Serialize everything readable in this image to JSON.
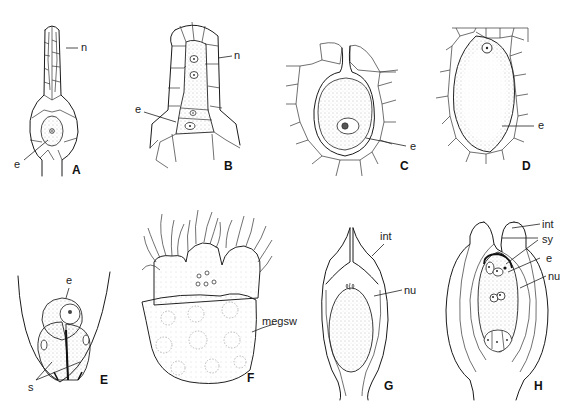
{
  "figure": {
    "panels": [
      {
        "id": "A",
        "label": "A",
        "annotations": [
          "n",
          "e"
        ]
      },
      {
        "id": "B",
        "label": "B",
        "annotations": [
          "n",
          "e"
        ]
      },
      {
        "id": "C",
        "label": "C",
        "annotations": [
          "e"
        ]
      },
      {
        "id": "D",
        "label": "D",
        "annotations": [
          "e"
        ]
      },
      {
        "id": "E",
        "label": "E",
        "annotations": [
          "e",
          "s"
        ]
      },
      {
        "id": "F",
        "label": "F",
        "annotations": [
          "megsw"
        ]
      },
      {
        "id": "G",
        "label": "G",
        "annotations": [
          "int",
          "nu"
        ]
      },
      {
        "id": "H",
        "label": "H",
        "annotations": [
          "int",
          "sy",
          "e",
          "nu"
        ]
      }
    ],
    "colors": {
      "line": "#1a1a1a",
      "background": "#ffffff",
      "stipple": "#888888"
    }
  }
}
